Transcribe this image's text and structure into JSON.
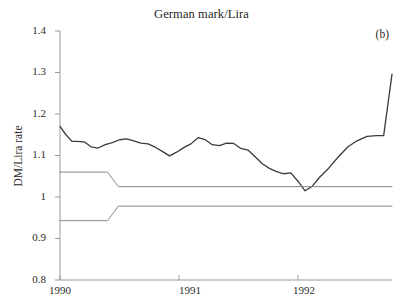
{
  "chart_data": {
    "type": "line",
    "title": "German mark/Lira",
    "panel_label": "(b)",
    "xlabel": "",
    "ylabel": "DM/Lira rate",
    "grid": false,
    "legend": "none",
    "xlim": [
      1990.0,
      1992.79
    ],
    "ylim": [
      0.8,
      1.4
    ],
    "xticks": [
      1990,
      1991,
      1992
    ],
    "xtick_labels": [
      "1990",
      "1991",
      "1992"
    ],
    "yticks": [
      0.8,
      0.9,
      1.0,
      1.1,
      1.2,
      1.3,
      1.4
    ],
    "ytick_labels": [
      "0.8",
      "0.9",
      "1",
      "1.1",
      "1.2",
      "1.3",
      "1.4"
    ],
    "axis_color": "#9a9a9a",
    "series": [
      {
        "name": "DM/Lira rate",
        "color": "#3b3b3b",
        "width": 1.3,
        "x": [
          1990.0,
          1990.05,
          1990.1,
          1990.15,
          1990.21,
          1990.26,
          1990.32,
          1990.38,
          1990.44,
          1990.5,
          1990.56,
          1990.62,
          1990.68,
          1990.74,
          1990.8,
          1990.86,
          1990.92,
          1990.98,
          1991.04,
          1991.1,
          1991.16,
          1991.22,
          1991.28,
          1991.34,
          1991.4,
          1991.46,
          1991.52,
          1991.58,
          1991.64,
          1991.7,
          1991.76,
          1991.82,
          1991.88,
          1991.94,
          1992.0,
          1992.06,
          1992.12,
          1992.18,
          1992.26,
          1992.34,
          1992.42,
          1992.5,
          1992.58,
          1992.66,
          1992.72,
          1992.79
        ],
        "values": [
          1.17,
          1.15,
          1.134,
          1.134,
          1.132,
          1.121,
          1.118,
          1.126,
          1.131,
          1.138,
          1.14,
          1.135,
          1.13,
          1.128,
          1.12,
          1.11,
          1.099,
          1.108,
          1.119,
          1.128,
          1.143,
          1.138,
          1.126,
          1.124,
          1.13,
          1.129,
          1.117,
          1.113,
          1.097,
          1.08,
          1.069,
          1.061,
          1.056,
          1.058,
          1.038,
          1.015,
          1.026,
          1.047,
          1.07,
          1.097,
          1.121,
          1.136,
          1.146,
          1.148,
          1.148,
          1.296
        ]
      },
      {
        "name": "upper band limit",
        "color": "#8a8a8a",
        "width": 1.0,
        "x": [
          1990.0,
          1990.4,
          1990.49,
          1992.79
        ],
        "values": [
          1.06,
          1.06,
          1.025,
          1.025
        ]
      },
      {
        "name": "lower band limit",
        "color": "#8a8a8a",
        "width": 1.0,
        "x": [
          1990.0,
          1990.4,
          1990.49,
          1992.79
        ],
        "values": [
          0.943,
          0.943,
          0.978,
          0.978
        ]
      }
    ],
    "annotations": []
  }
}
